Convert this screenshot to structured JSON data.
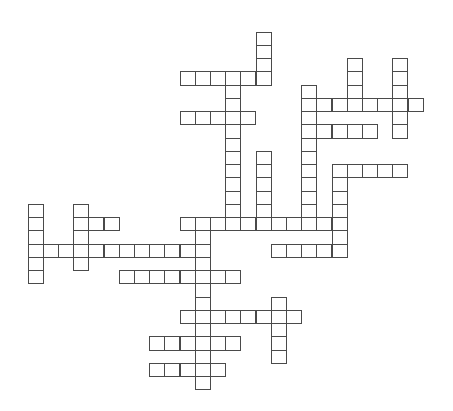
{
  "puzzle": {
    "type": "crossword",
    "grid_origin": {
      "x": 28,
      "y": 32
    },
    "cell_size": {
      "w": 15.2,
      "h": 13.25
    },
    "line_color": "#4a4a4a",
    "background_color": "#ffffff",
    "rows": [
      {
        "r": 0,
        "runs": [
          [
            15,
            15
          ]
        ]
      },
      {
        "r": 1,
        "runs": [
          [
            15,
            15
          ]
        ]
      },
      {
        "r": 2,
        "runs": [
          [
            15,
            15
          ],
          [
            21,
            21
          ],
          [
            24,
            24
          ]
        ]
      },
      {
        "r": 3,
        "runs": [
          [
            10,
            15
          ],
          [
            21,
            21
          ],
          [
            24,
            24
          ]
        ]
      },
      {
        "r": 4,
        "runs": [
          [
            13,
            13
          ],
          [
            18,
            18
          ],
          [
            21,
            21
          ],
          [
            24,
            24
          ]
        ]
      },
      {
        "r": 5,
        "runs": [
          [
            13,
            13
          ],
          [
            18,
            25
          ]
        ]
      },
      {
        "r": 6,
        "runs": [
          [
            10,
            14
          ],
          [
            18,
            18
          ],
          [
            24,
            24
          ]
        ]
      },
      {
        "r": 7,
        "runs": [
          [
            13,
            13
          ],
          [
            18,
            22
          ],
          [
            24,
            24
          ]
        ]
      },
      {
        "r": 8,
        "runs": [
          [
            13,
            13
          ],
          [
            18,
            18
          ]
        ]
      },
      {
        "r": 9,
        "runs": [
          [
            13,
            13
          ],
          [
            15,
            15
          ],
          [
            18,
            18
          ]
        ]
      },
      {
        "r": 10,
        "runs": [
          [
            13,
            13
          ],
          [
            15,
            15
          ],
          [
            18,
            18
          ],
          [
            20,
            24
          ]
        ]
      },
      {
        "r": 11,
        "runs": [
          [
            13,
            13
          ],
          [
            15,
            15
          ],
          [
            18,
            18
          ],
          [
            20,
            20
          ]
        ]
      },
      {
        "r": 12,
        "runs": [
          [
            13,
            13
          ],
          [
            15,
            15
          ],
          [
            18,
            18
          ],
          [
            20,
            20
          ]
        ]
      },
      {
        "r": 13,
        "runs": [
          [
            0,
            0
          ],
          [
            3,
            3
          ],
          [
            13,
            13
          ],
          [
            15,
            15
          ],
          [
            18,
            18
          ],
          [
            20,
            20
          ]
        ]
      },
      {
        "r": 14,
        "runs": [
          [
            0,
            0
          ],
          [
            3,
            5
          ],
          [
            10,
            20
          ]
        ]
      },
      {
        "r": 15,
        "runs": [
          [
            0,
            0
          ],
          [
            3,
            3
          ],
          [
            11,
            11
          ],
          [
            20,
            20
          ]
        ]
      },
      {
        "r": 16,
        "runs": [
          [
            0,
            11
          ],
          [
            16,
            20
          ]
        ]
      },
      {
        "r": 17,
        "runs": [
          [
            0,
            0
          ],
          [
            3,
            3
          ],
          [
            11,
            11
          ]
        ]
      },
      {
        "r": 18,
        "runs": [
          [
            0,
            0
          ],
          [
            6,
            13
          ]
        ]
      },
      {
        "r": 19,
        "runs": [
          [
            11,
            11
          ]
        ]
      },
      {
        "r": 20,
        "runs": [
          [
            11,
            11
          ],
          [
            16,
            16
          ]
        ]
      },
      {
        "r": 21,
        "runs": [
          [
            10,
            17
          ]
        ]
      },
      {
        "r": 22,
        "runs": [
          [
            11,
            11
          ],
          [
            16,
            16
          ]
        ]
      },
      {
        "r": 23,
        "runs": [
          [
            8,
            13
          ],
          [
            16,
            16
          ]
        ]
      },
      {
        "r": 24,
        "runs": [
          [
            11,
            11
          ],
          [
            16,
            16
          ]
        ]
      },
      {
        "r": 25,
        "runs": [
          [
            8,
            12
          ]
        ]
      },
      {
        "r": 26,
        "runs": [
          [
            11,
            11
          ]
        ]
      }
    ]
  }
}
